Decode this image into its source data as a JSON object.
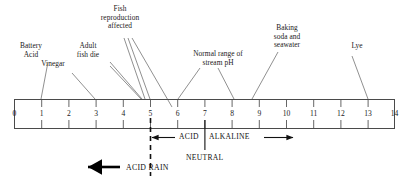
{
  "diagram": {
    "scale": {
      "min": 0,
      "max": 14,
      "ticks": [
        "0",
        "1",
        "2",
        "3",
        "4",
        "5",
        "6",
        "7",
        "8",
        "9",
        "10",
        "11",
        "12",
        "13",
        "14"
      ]
    },
    "callouts": [
      {
        "id": "battery-acid",
        "text": "Battery\nAcid",
        "target_ph": 1
      },
      {
        "id": "vinegar",
        "text": "Vinegar",
        "target_ph": 3
      },
      {
        "id": "adult-fish-die",
        "text": "Adult\nfish die",
        "target_ph": 5
      },
      {
        "id": "fish-reproduction",
        "text": "Fish\nreproduction\naffected",
        "target_ph": 5
      },
      {
        "id": "normal-stream-ph",
        "text": "Normal range of\nstream pH",
        "target_ph": 7
      },
      {
        "id": "baking-soda",
        "text": "Baking\nsoda and\nseawater",
        "target_ph": 9
      },
      {
        "id": "lye",
        "text": "Lye",
        "target_ph": 13
      }
    ],
    "zones": {
      "acid_label": "ACID",
      "alkaline_label": "ALKALINE",
      "neutral_label": "NEUTRAL",
      "neutral_ph": 7,
      "acid_arrow_ph": 5
    },
    "acid_rain": {
      "label": "ACID RAIN",
      "boundary_ph": 5
    },
    "colors": {
      "line": "#4a4a4a",
      "leader": "#6b6b6b",
      "text": "#111111",
      "bold_arrow": "#000000"
    }
  }
}
